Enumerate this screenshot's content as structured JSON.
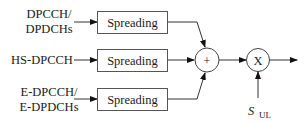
{
  "diagram": {
    "inputs": [
      {
        "line1": "DPCCH/",
        "line2": "DPDCHs"
      },
      {
        "line1": "HS-DPCCH",
        "line2": ""
      },
      {
        "line1": "E-DPCCH/",
        "line2": "E-DPDCHs"
      }
    ],
    "blocks": [
      {
        "label": "Spreading"
      },
      {
        "label": "Spreading"
      },
      {
        "label": "Spreading"
      }
    ],
    "sum_node": {
      "symbol": "+"
    },
    "multiply_node": {
      "symbol": "X"
    },
    "scrambling": {
      "main": "S",
      "subscript": "UL"
    }
  }
}
